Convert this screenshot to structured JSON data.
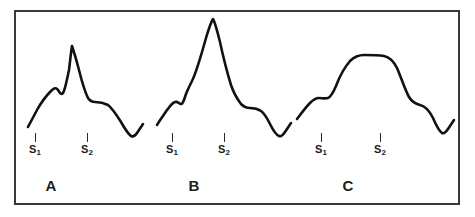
{
  "figure": {
    "background_color": "#ffffff",
    "frame_color": "#3a3a3a",
    "trace_color": "#111111",
    "label_color": "#1c1c1c"
  },
  "panels": [
    {
      "letter": "A",
      "letter_x": 51,
      "letter_y": 178,
      "markers": [
        {
          "name": "S1",
          "base": "S",
          "sub": "1",
          "x": 35,
          "y": 133
        },
        {
          "name": "S2",
          "base": "S",
          "sub": "2",
          "x": 87,
          "y": 133
        }
      ],
      "path": "M 28,127 L 37,110 C 42,101 46,96 51,91 C 54,88 56,87 58,90 C 60,93 61,95 63,93 C 65,90 66,84 69,70 C 70,62 71,52 72,46 C 73,49 76,58 79,70 C 82,82 85,92 88,98 C 90,101 92,102 95,102 C 99,102 104,103 108,105 C 112,108 116,114 121,122 C 125,129 128,134 131,136 C 133,137 135,136 137,133 C 139,130 141,127 143,124"
    },
    {
      "letter": "B",
      "letter_x": 194,
      "letter_y": 178,
      "markers": [
        {
          "name": "S1",
          "base": "S",
          "sub": "1",
          "x": 172,
          "y": 133
        },
        {
          "name": "S2",
          "base": "S",
          "sub": "2",
          "x": 224,
          "y": 133
        }
      ],
      "path": "M 157,125 C 160,120 163,116 167,110 C 170,106 172,103 175,102 C 178,101 179,104 181,104 C 183,104 184,100 186,94 C 188,89 190,85 192,81 C 196,73 201,56 206,38 C 209,28 211,22 213,19 C 215,22 217,30 220,42 C 223,56 227,72 231,85 C 234,94 238,100 241,104 C 244,107 247,108 250,108 C 254,108 258,109 261,111 C 264,113 267,118 270,124 C 273,130 276,135 279,136 C 281,137 283,135 285,132 C 287,129 289,126 291,123"
    },
    {
      "letter": "C",
      "letter_x": 348,
      "letter_y": 178,
      "markers": [
        {
          "name": "S1",
          "base": "S",
          "sub": "1",
          "x": 321,
          "y": 133
        },
        {
          "name": "S2",
          "base": "S",
          "sub": "2",
          "x": 380,
          "y": 133
        }
      ],
      "path": "M 297,119 C 301,114 305,108 310,103 C 313,100 316,98 319,98 C 322,98 325,99 328,98 C 331,97 333,93 336,86 C 339,78 344,68 350,61 C 354,57 358,55 364,55 C 371,55 378,55 384,56 C 389,57 393,60 397,68 C 401,77 405,90 409,97 C 412,102 416,104 420,105 C 425,106 429,110 433,118 C 436,125 439,131 442,133 C 444,134 446,132 448,129 C 450,126 452,123 454,120"
    }
  ]
}
